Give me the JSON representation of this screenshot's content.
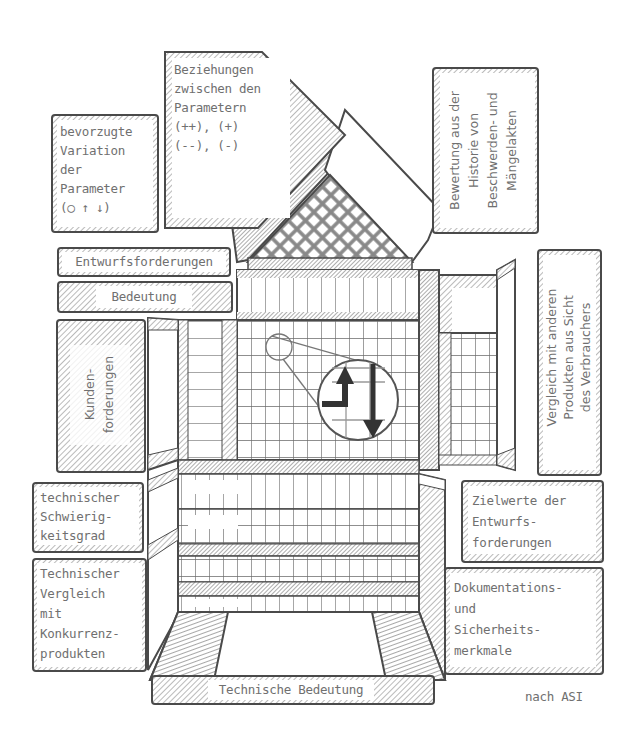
{
  "diagram": {
    "type": "House of Quality (QFD)",
    "source_note": "nach ASI",
    "colors": {
      "line": "#4a4a4a",
      "hatch": "#9a9a9a",
      "text": "#707070",
      "background": "#ffffff"
    },
    "labels": {
      "beziehungen": {
        "lines": [
          "Beziehungen",
          "zwischen den",
          "Parametern",
          "(++), (+)",
          "(--), (-)"
        ]
      },
      "bevorzugte": {
        "lines": [
          "bevorzugte",
          "Variation",
          "der",
          "Parameter",
          "(○ ↑ ↓)"
        ]
      },
      "bewertung": {
        "lines": [
          "Bewertung aus der",
          "Historie von",
          "Beschwerden- und",
          "Mängelakten"
        ]
      },
      "entwurfsforderungen": "Entwurfsforderungen",
      "bedeutung": "Bedeutung",
      "kundenforderungen": {
        "lines": [
          "Kunden-",
          "forderungen"
        ]
      },
      "vergleich": {
        "lines": [
          "Vergleich mit anderen",
          "Produkten aus Sicht",
          "des Verbrauchers"
        ]
      },
      "schwierigkeitsgrad": {
        "lines": [
          "technischer",
          "Schwierig-",
          "keitsgrad"
        ]
      },
      "technischer_vergleich": {
        "lines": [
          "Technischer",
          "Vergleich",
          "mit",
          "Konkurrenz-",
          "produkten"
        ]
      },
      "zielwerte": {
        "lines": [
          "Zielwerte der",
          "Entwurfs-",
          "forderungen"
        ]
      },
      "dokumentation": {
        "lines": [
          "Dokumentations-",
          "und",
          "Sicherheits-",
          "merkmale"
        ]
      },
      "technische_bedeutung": "Technische Bedeutung"
    },
    "matrix": {
      "columns": 13,
      "rows": 18,
      "magnifier_symbols": [
        "up-arrow",
        "down-arrow"
      ]
    }
  }
}
